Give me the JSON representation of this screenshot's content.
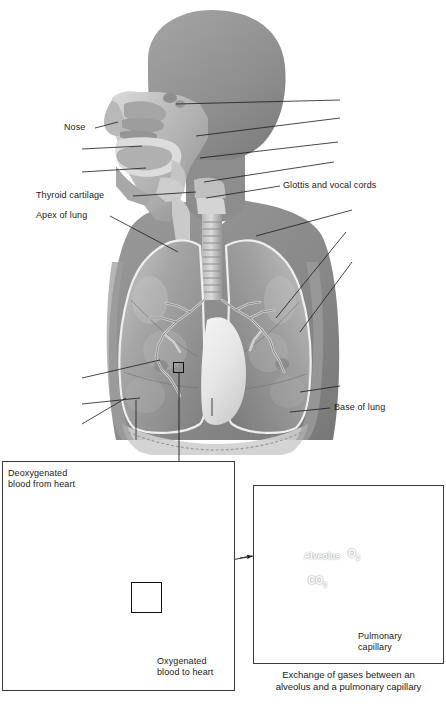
{
  "figure": {
    "background_color": "#ffffff",
    "body_silhouette_color": "#8a8a8a",
    "label_color": "#1a1a1a",
    "box_border_color": "#3a3a3a"
  },
  "main_labels": {
    "nose": "Nose",
    "thyroid_cartilage": "Thyroid cartilage",
    "apex_of_lung": "Apex of lung",
    "glottis_and_vocal_cords": "Glottis and vocal cords",
    "base_of_lung": "Base of lung"
  },
  "left_panel": {
    "deoxygenated": "Deoxygenated\nblood from heart",
    "oxygenated": "Oxygenated\nblood to heart"
  },
  "right_panel": {
    "alveolus": "Alveolus",
    "oxygen": "O",
    "oxygen_sub": "2",
    "carbon_dioxide": "CO",
    "carbon_dioxide_sub": "2",
    "pulmonary_capillary": "Pulmonary\ncapillary",
    "caption": "Exchange of gases between an\nalveolus and a pulmonary capillary"
  }
}
